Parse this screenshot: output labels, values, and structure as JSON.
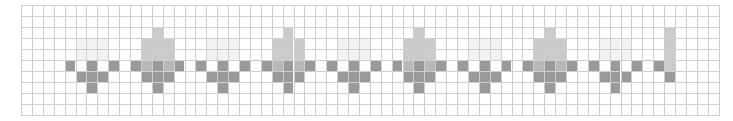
{
  "grid": {
    "cols": 64,
    "rows": 10,
    "cell_w": 10.9,
    "cell_h": 11,
    "line_color": "#cfcfcf",
    "background": "#ffffff"
  },
  "palette": {
    "dark": "#9a9a9a",
    "overlap": "#b8b8b8",
    "light": "#cacaca",
    "ghost": "#f2f2f2"
  },
  "patterns": {
    "small": [
      {
        "dc": 1,
        "r": 3,
        "c": "ghost"
      },
      {
        "dc": 2,
        "r": 3,
        "c": "ghost"
      },
      {
        "dc": 3,
        "r": 3,
        "c": "ghost"
      },
      {
        "dc": 1,
        "r": 4,
        "c": "ghost"
      },
      {
        "dc": 2,
        "r": 4,
        "c": "ghost"
      },
      {
        "dc": 3,
        "r": 4,
        "c": "ghost"
      },
      {
        "dc": 0,
        "r": 5,
        "c": "dark"
      },
      {
        "dc": 2,
        "r": 5,
        "c": "dark"
      },
      {
        "dc": 4,
        "r": 5,
        "c": "dark"
      },
      {
        "dc": 1,
        "r": 6,
        "c": "dark"
      },
      {
        "dc": 2,
        "r": 6,
        "c": "dark"
      },
      {
        "dc": 3,
        "r": 6,
        "c": "dark"
      },
      {
        "dc": 2,
        "r": 7,
        "c": "dark"
      }
    ],
    "big": [
      {
        "dc": 2,
        "r": 2,
        "c": "light"
      },
      {
        "dc": 1,
        "r": 3,
        "c": "light"
      },
      {
        "dc": 2,
        "r": 3,
        "c": "light"
      },
      {
        "dc": 3,
        "r": 3,
        "c": "light"
      },
      {
        "dc": 1,
        "r": 4,
        "c": "light"
      },
      {
        "dc": 2,
        "r": 4,
        "c": "light"
      },
      {
        "dc": 3,
        "r": 4,
        "c": "light"
      },
      {
        "dc": 0,
        "r": 5,
        "c": "dark"
      },
      {
        "dc": 1,
        "r": 5,
        "c": "overlap"
      },
      {
        "dc": 2,
        "r": 5,
        "c": "dark"
      },
      {
        "dc": 3,
        "r": 5,
        "c": "overlap"
      },
      {
        "dc": 4,
        "r": 5,
        "c": "dark"
      },
      {
        "dc": 1,
        "r": 6,
        "c": "dark"
      },
      {
        "dc": 2,
        "r": 6,
        "c": "dark"
      },
      {
        "dc": 3,
        "r": 6,
        "c": "dark"
      },
      {
        "dc": 2,
        "r": 7,
        "c": "dark"
      }
    ]
  },
  "placements": [
    {
      "pattern": "small",
      "col": 4
    },
    {
      "pattern": "big",
      "col": 10
    },
    {
      "pattern": "small",
      "col": 16
    },
    {
      "pattern": "big",
      "col": 22
    },
    {
      "pattern": "small",
      "col": 28
    },
    {
      "pattern": "big",
      "col": 34
    },
    {
      "pattern": "small",
      "col": 40
    },
    {
      "pattern": "big",
      "col": 46
    },
    {
      "pattern": "small",
      "col": 52
    }
  ],
  "extra_cells": [
    {
      "col": 58,
      "r": 5,
      "c": "dark"
    },
    {
      "col": 59,
      "r": 2,
      "c": "light"
    },
    {
      "col": 59,
      "r": 3,
      "c": "light"
    },
    {
      "col": 59,
      "r": 4,
      "c": "light"
    },
    {
      "col": 59,
      "r": 5,
      "c": "light"
    },
    {
      "col": 59,
      "r": 6,
      "c": "dark"
    }
  ]
}
